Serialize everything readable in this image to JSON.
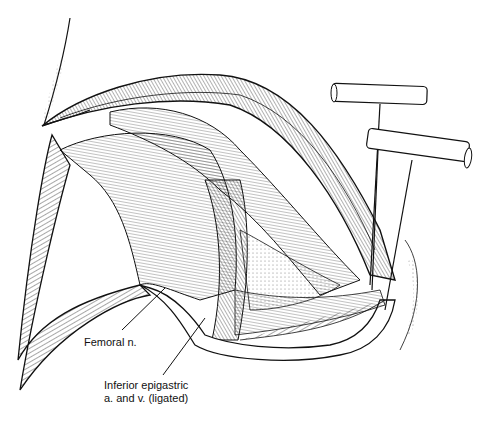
{
  "figure": {
    "labels": [
      {
        "id": "femoral-nerve",
        "text": "Femoral n."
      },
      {
        "id": "inferior-epigastric-line1",
        "text": "Inferior epigastric"
      },
      {
        "id": "inferior-epigastric-line2",
        "text": "a. and v. (ligated)"
      }
    ],
    "colors": {
      "ink": "#111111",
      "paper": "#ffffff",
      "shade": "#888888"
    }
  }
}
